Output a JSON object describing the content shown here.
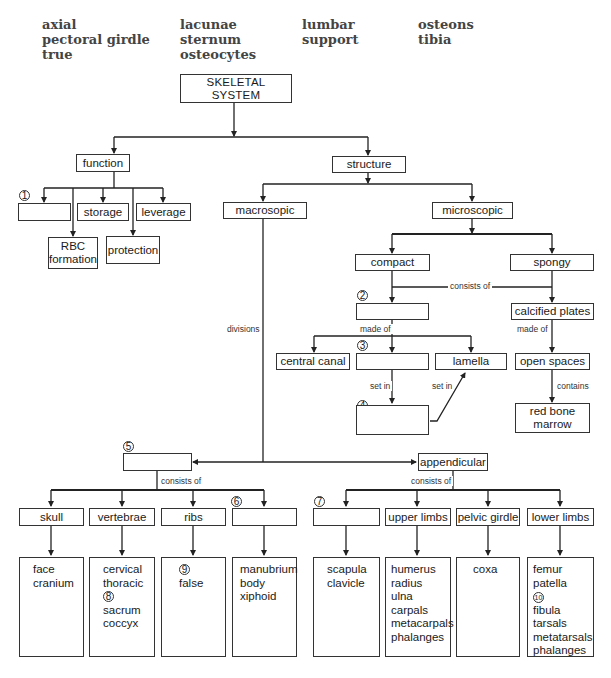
{
  "word_bank": {
    "columns": [
      [
        "axial",
        "pectoral girdle",
        "true"
      ],
      [
        "lacunae",
        "sternum",
        "osteocytes"
      ],
      [
        "lumbar",
        "support"
      ],
      [
        "osteons",
        "tibia"
      ]
    ]
  },
  "root": {
    "label": "SKELETAL SYSTEM"
  },
  "function": {
    "label": "function",
    "children": {
      "blank1": {
        "number": "1",
        "label": ""
      },
      "storage": "storage",
      "leverage": "leverage",
      "rbc": "RBC formation",
      "protection": "protection"
    }
  },
  "structure": {
    "label": "structure",
    "macroscopic": {
      "label": "macrosopic",
      "edge_label": "divisions"
    },
    "microscopic": {
      "label": "microscopic",
      "compact": "compact",
      "spongy": "spongy",
      "edge_consists_of": "consists of",
      "blank2": {
        "number": "2",
        "label": ""
      },
      "edge_made_of_left": "made of",
      "central_canal": "central canal",
      "blank3": {
        "number": "3",
        "label": ""
      },
      "lamella": "lamella",
      "edge_set_in_1": "set in",
      "edge_set_in_2": "set in",
      "blank4": {
        "number": "4",
        "label": ""
      },
      "calcified_plates": "calcified plates",
      "edge_made_of_right": "made of",
      "open_spaces": "open spaces",
      "edge_contains": "contains",
      "red_bone_marrow": "red bone marrow"
    }
  },
  "divisions": {
    "blank5": {
      "number": "5",
      "label": ""
    },
    "appendicular": "appendicular",
    "edge_consists_of_left": "consists of",
    "edge_consists_of_right": "consists of",
    "axial_parts": [
      {
        "label": "skull",
        "items": [
          "face",
          "cranium"
        ]
      },
      {
        "label": "vertebrae",
        "items": [
          "cervical",
          "thoracic",
          "8",
          "sacrum",
          "coccyx"
        ]
      },
      {
        "label": "ribs",
        "items": [
          "9",
          "false"
        ]
      },
      {
        "label": "",
        "number": "6",
        "items": [
          "manubrium",
          "body",
          "xiphoid"
        ]
      }
    ],
    "appendicular_parts": [
      {
        "label": "",
        "number": "7",
        "items": [
          "scapula",
          "clavicle"
        ]
      },
      {
        "label": "upper limbs",
        "items": [
          "humerus",
          "radius",
          "ulna",
          "carpals",
          "metacarpals",
          "phalanges"
        ]
      },
      {
        "label": "pelvic girdle",
        "items": [
          "coxa"
        ]
      },
      {
        "label": "lower limbs",
        "items": [
          "femur",
          "patella",
          "10",
          "fibula",
          "tarsals",
          "metatarsals",
          "phalanges"
        ]
      }
    ]
  },
  "colors": {
    "line": "#222222",
    "text": "#1a1a1a",
    "wordbank": "#444444"
  }
}
